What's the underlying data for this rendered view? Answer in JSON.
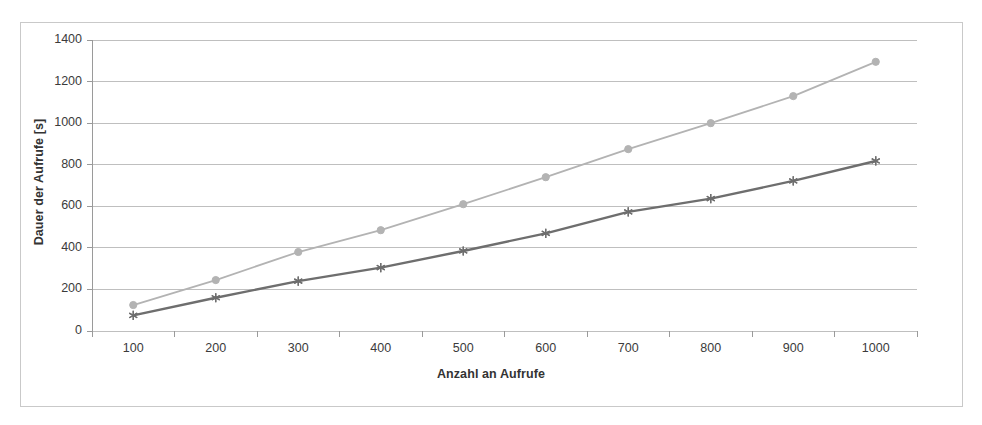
{
  "chart_data": {
    "type": "line",
    "title": "",
    "xlabel": "Anzahl an Aufrufe",
    "ylabel": "Dauer der Aufrufe [s]",
    "x": [
      100,
      200,
      300,
      400,
      500,
      600,
      700,
      800,
      900,
      1000
    ],
    "categories": [
      "100",
      "200",
      "300",
      "400",
      "500",
      "600",
      "700",
      "800",
      "900",
      "1000"
    ],
    "xlim": [
      0,
      1100
    ],
    "ylim": [
      0,
      1400
    ],
    "ytick_labels": [
      "0",
      "200",
      "400",
      "600",
      "800",
      "1000",
      "1200",
      "1400"
    ],
    "ytick_values": [
      0,
      200,
      400,
      600,
      800,
      1000,
      1200,
      1400
    ],
    "grid": true,
    "grid_axis": "y",
    "legend": false,
    "legend_position": "none",
    "series": [
      {
        "name": "series-light",
        "color": "#b3b3b3",
        "marker": "circle",
        "values": [
          125,
          245,
          380,
          485,
          610,
          740,
          875,
          1000,
          1130,
          1295
        ]
      },
      {
        "name": "series-dark",
        "color": "#6e6e6e",
        "marker": "star",
        "values": [
          75,
          160,
          240,
          305,
          385,
          470,
          573,
          637,
          722,
          818
        ]
      }
    ]
  },
  "style": {
    "frame_border_color": "#c9c9c9",
    "grid_color": "#bfbfbf",
    "axis_color": "#9a9a9a",
    "tick_text_color": "#3b3b3b",
    "label_color": "#333333",
    "background": "#ffffff"
  }
}
